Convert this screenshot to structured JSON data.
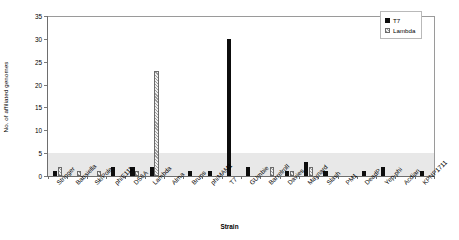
{
  "chart_data": {
    "type": "bar",
    "title": "",
    "xlabel": "Strain",
    "ylabel": "No. of affiliated genomes",
    "ylim": [
      0,
      35
    ],
    "yticks": [
      0,
      5,
      10,
      15,
      20,
      25,
      30,
      35
    ],
    "grid": false,
    "legend_position": "top-right",
    "shaded_band": [
      0,
      5
    ],
    "categories": [
      "Stringer",
      "Babsiella",
      "SkiPole",
      "phiE111",
      "DS6A",
      "Lambda",
      "Alma",
      "Bruns",
      "phiMAM1",
      "T7",
      "GUmbie",
      "Barrelroll",
      "Davies",
      "Maynard",
      "Slash",
      "PM1",
      "DeadP",
      "Yep-phi",
      "Acdian",
      "KPNP1711"
    ],
    "series": [
      {
        "name": "T7",
        "color": "#0d0d0d",
        "values": [
          1,
          0,
          0,
          2,
          2,
          2,
          0,
          1,
          1,
          30,
          2,
          0,
          1,
          3,
          1,
          0,
          1,
          2,
          0,
          1
        ]
      },
      {
        "name": "Lambda",
        "color": "#9e9e9e",
        "values": [
          2,
          1,
          1,
          0,
          1,
          23,
          0,
          0,
          0,
          0,
          0,
          2,
          1,
          2,
          0,
          0,
          0,
          0,
          0,
          0
        ]
      }
    ]
  },
  "legend": {
    "entries": [
      {
        "label": "T7",
        "icon": "filled-square-icon"
      },
      {
        "label": "Lambda",
        "icon": "hatched-square-icon"
      }
    ]
  },
  "axes": {
    "y_title": "No. of affiliated genomes",
    "x_title": "Strain",
    "y_tick_labels": [
      "0",
      "5",
      "10",
      "15",
      "20",
      "25",
      "30",
      "35"
    ]
  }
}
